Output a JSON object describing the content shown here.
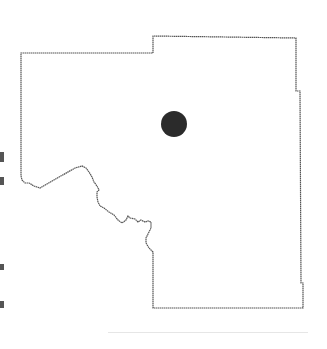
{
  "map": {
    "type": "county-locator",
    "outline_color": "#555555",
    "background_color": "#ffffff",
    "marker": {
      "shape": "circle",
      "color": "#2b2b2b",
      "cx": 174,
      "cy": 124,
      "r": 13
    }
  },
  "colors": {
    "outline": "#555555",
    "marker": "#2b2b2b",
    "background": "#ffffff"
  }
}
